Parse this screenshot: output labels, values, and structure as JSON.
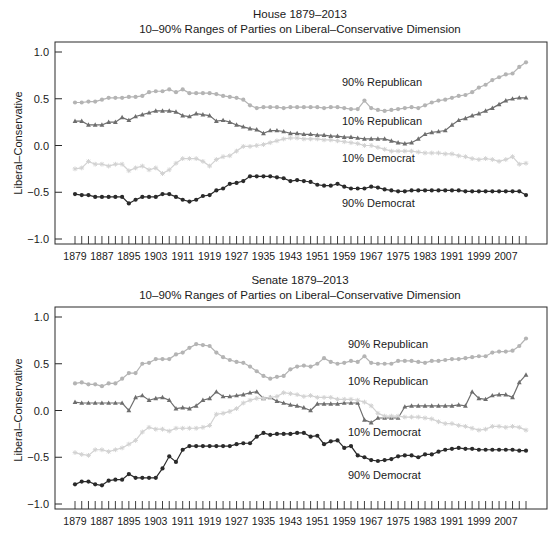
{
  "chart_data": [
    {
      "type": "line",
      "title": "House 1879–2013",
      "subtitle": "10–90% Ranges of Parties on Liberal–Conservative Dimension",
      "xlabel": "",
      "ylabel": "Liberal–Conservative",
      "ylim": [
        -1.0,
        1.0
      ],
      "yticks": [
        "1.0",
        "0.5",
        "0.0",
        "-0.5",
        "-1.0"
      ],
      "xtick_labels": [
        "1879",
        "1887",
        "1895",
        "1903",
        "1911",
        "1919",
        "1927",
        "1935",
        "1943",
        "1951",
        "1959",
        "1967",
        "1975",
        "1983",
        "1991",
        "1999",
        "2007"
      ],
      "x_start": 1879,
      "x_step": 2,
      "x_end": 2013,
      "grid": false,
      "legend": "inline annotations",
      "series": [
        {
          "name": "90% Republican",
          "color": "#b4b4b4",
          "marker": "circle",
          "values": [
            0.46,
            0.46,
            0.47,
            0.47,
            0.49,
            0.51,
            0.51,
            0.51,
            0.52,
            0.52,
            0.53,
            0.57,
            0.58,
            0.58,
            0.6,
            0.57,
            0.6,
            0.56,
            0.56,
            0.56,
            0.56,
            0.55,
            0.53,
            0.52,
            0.51,
            0.49,
            0.43,
            0.4,
            0.41,
            0.41,
            0.41,
            0.4,
            0.41,
            0.41,
            0.41,
            0.41,
            0.41,
            0.4,
            0.41,
            0.41,
            0.4,
            0.39,
            0.39,
            0.48,
            0.4,
            0.38,
            0.37,
            0.38,
            0.39,
            0.4,
            0.41,
            0.4,
            0.43,
            0.46,
            0.48,
            0.49,
            0.51,
            0.53,
            0.54,
            0.57,
            0.62,
            0.65,
            0.7,
            0.73,
            0.76,
            0.77,
            0.84,
            0.89,
            0.97
          ]
        },
        {
          "name": "10% Republican",
          "color": "#6e6e6e",
          "marker": "triangle",
          "values": [
            0.26,
            0.26,
            0.22,
            0.22,
            0.22,
            0.25,
            0.25,
            0.3,
            0.27,
            0.31,
            0.33,
            0.35,
            0.37,
            0.37,
            0.37,
            0.36,
            0.32,
            0.31,
            0.34,
            0.33,
            0.32,
            0.26,
            0.27,
            0.25,
            0.22,
            0.2,
            0.18,
            0.17,
            0.13,
            0.16,
            0.16,
            0.15,
            0.13,
            0.13,
            0.12,
            0.12,
            0.11,
            0.11,
            0.1,
            0.1,
            0.09,
            0.09,
            0.08,
            0.07,
            0.07,
            0.07,
            0.07,
            0.05,
            0.03,
            0.02,
            0.03,
            0.07,
            0.12,
            0.14,
            0.15,
            0.16,
            0.22,
            0.27,
            0.29,
            0.32,
            0.34,
            0.37,
            0.4,
            0.44,
            0.48,
            0.5,
            0.51,
            0.51,
            0.52
          ]
        },
        {
          "name": "10% Democrat",
          "color": "#d2d2d2",
          "marker": "star",
          "values": [
            -0.25,
            -0.24,
            -0.17,
            -0.2,
            -0.2,
            -0.22,
            -0.2,
            -0.2,
            -0.27,
            -0.24,
            -0.22,
            -0.26,
            -0.24,
            -0.3,
            -0.26,
            -0.19,
            -0.14,
            -0.14,
            -0.14,
            -0.17,
            -0.22,
            -0.15,
            -0.12,
            -0.11,
            -0.06,
            -0.01,
            -0.01,
            0.0,
            0.01,
            0.03,
            0.05,
            0.07,
            0.08,
            0.08,
            0.07,
            0.07,
            0.07,
            0.06,
            0.06,
            0.05,
            0.04,
            0.03,
            0.02,
            0.0,
            0.0,
            -0.02,
            -0.04,
            -0.06,
            -0.06,
            -0.06,
            -0.06,
            -0.07,
            -0.08,
            -0.08,
            -0.08,
            -0.09,
            -0.09,
            -0.11,
            -0.12,
            -0.14,
            -0.15,
            -0.14,
            -0.15,
            -0.17,
            -0.15,
            -0.12,
            -0.2,
            -0.19,
            -0.18
          ]
        },
        {
          "name": "90% Democrat",
          "color": "#2a2a2a",
          "marker": "circle",
          "values": [
            -0.52,
            -0.53,
            -0.53,
            -0.55,
            -0.55,
            -0.55,
            -0.55,
            -0.55,
            -0.62,
            -0.58,
            -0.55,
            -0.55,
            -0.55,
            -0.52,
            -0.52,
            -0.55,
            -0.58,
            -0.6,
            -0.58,
            -0.54,
            -0.53,
            -0.48,
            -0.46,
            -0.41,
            -0.4,
            -0.38,
            -0.33,
            -0.33,
            -0.33,
            -0.33,
            -0.34,
            -0.35,
            -0.38,
            -0.37,
            -0.38,
            -0.39,
            -0.42,
            -0.43,
            -0.43,
            -0.41,
            -0.44,
            -0.46,
            -0.46,
            -0.46,
            -0.44,
            -0.45,
            -0.47,
            -0.48,
            -0.49,
            -0.49,
            -0.48,
            -0.48,
            -0.48,
            -0.48,
            -0.48,
            -0.48,
            -0.48,
            -0.48,
            -0.49,
            -0.49,
            -0.49,
            -0.49,
            -0.49,
            -0.49,
            -0.49,
            -0.49,
            -0.49,
            -0.53,
            -0.5
          ]
        }
      ],
      "annotations": [
        "90% Republican",
        "10% Republican",
        "10% Democrat",
        "90% Democrat"
      ]
    },
    {
      "type": "line",
      "title": "Senate 1879–2013",
      "subtitle": "10–90% Ranges of Parties on Liberal–Conservative Dimension",
      "xlabel": "",
      "ylabel": "Liberal–Conservative",
      "ylim": [
        -1.0,
        1.0
      ],
      "yticks": [
        "1.0",
        "0.5",
        "0.0",
        "-0.5",
        "-1.0"
      ],
      "xtick_labels": [
        "1879",
        "1887",
        "1895",
        "1903",
        "1911",
        "1919",
        "1927",
        "1935",
        "1943",
        "1951",
        "1959",
        "1967",
        "1975",
        "1983",
        "1991",
        "1999",
        "2007"
      ],
      "x_start": 1879,
      "x_step": 2,
      "x_end": 2013,
      "grid": false,
      "legend": "inline annotations",
      "series": [
        {
          "name": "90% Republican",
          "color": "#b4b4b4",
          "marker": "circle",
          "values": [
            0.29,
            0.3,
            0.28,
            0.28,
            0.26,
            0.29,
            0.29,
            0.34,
            0.4,
            0.4,
            0.5,
            0.51,
            0.55,
            0.55,
            0.55,
            0.6,
            0.62,
            0.67,
            0.71,
            0.7,
            0.69,
            0.62,
            0.57,
            0.54,
            0.52,
            0.51,
            0.47,
            0.42,
            0.37,
            0.34,
            0.36,
            0.37,
            0.44,
            0.47,
            0.48,
            0.47,
            0.5,
            0.56,
            0.52,
            0.5,
            0.51,
            0.53,
            0.52,
            0.58,
            0.51,
            0.5,
            0.5,
            0.5,
            0.53,
            0.53,
            0.53,
            0.52,
            0.51,
            0.53,
            0.53,
            0.54,
            0.55,
            0.55,
            0.56,
            0.57,
            0.58,
            0.58,
            0.62,
            0.63,
            0.63,
            0.64,
            0.69,
            0.77,
            0.78,
            0.78
          ]
        },
        {
          "name": "10% Republican",
          "color": "#6e6e6e",
          "marker": "triangle",
          "values": [
            0.09,
            0.08,
            0.08,
            0.08,
            0.08,
            0.08,
            0.08,
            0.08,
            0.0,
            0.14,
            0.16,
            0.11,
            0.13,
            0.14,
            0.11,
            0.02,
            0.03,
            0.02,
            0.05,
            0.11,
            0.13,
            0.2,
            0.15,
            0.15,
            0.16,
            0.17,
            0.19,
            0.2,
            0.13,
            0.14,
            0.1,
            0.08,
            0.06,
            0.05,
            0.03,
            0.0,
            0.07,
            0.07,
            0.07,
            0.07,
            0.08,
            0.08,
            0.08,
            -0.1,
            -0.13,
            -0.08,
            -0.08,
            -0.08,
            -0.08,
            0.04,
            0.05,
            0.05,
            0.05,
            0.05,
            0.05,
            0.05,
            0.05,
            0.06,
            0.05,
            0.2,
            0.13,
            0.12,
            0.16,
            0.17,
            0.17,
            0.14,
            0.3,
            0.38
          ]
        },
        {
          "name": "10% Democrat",
          "color": "#d2d2d2",
          "marker": "star",
          "values": [
            -0.45,
            -0.47,
            -0.48,
            -0.42,
            -0.42,
            -0.44,
            -0.42,
            -0.4,
            -0.36,
            -0.32,
            -0.23,
            -0.18,
            -0.2,
            -0.2,
            -0.22,
            -0.19,
            -0.19,
            -0.19,
            -0.19,
            -0.18,
            -0.16,
            -0.04,
            -0.03,
            -0.01,
            0.02,
            0.08,
            0.11,
            0.13,
            0.13,
            0.14,
            0.15,
            0.19,
            0.18,
            0.17,
            0.15,
            0.16,
            0.14,
            0.14,
            0.14,
            0.12,
            0.12,
            0.12,
            0.11,
            0.09,
            0.05,
            -0.03,
            -0.06,
            -0.06,
            -0.06,
            -0.07,
            -0.07,
            -0.07,
            -0.08,
            -0.09,
            -0.12,
            -0.14,
            -0.14,
            -0.16,
            -0.17,
            -0.19,
            -0.21,
            -0.2,
            -0.17,
            -0.17,
            -0.18,
            -0.17,
            -0.18,
            -0.21
          ]
        },
        {
          "name": "90% Democrat",
          "color": "#2a2a2a",
          "marker": "circle",
          "values": [
            -0.79,
            -0.76,
            -0.76,
            -0.79,
            -0.8,
            -0.75,
            -0.74,
            -0.74,
            -0.68,
            -0.72,
            -0.72,
            -0.72,
            -0.72,
            -0.62,
            -0.49,
            -0.55,
            -0.42,
            -0.38,
            -0.38,
            -0.38,
            -0.38,
            -0.38,
            -0.38,
            -0.38,
            -0.36,
            -0.35,
            -0.35,
            -0.28,
            -0.24,
            -0.26,
            -0.25,
            -0.25,
            -0.25,
            -0.24,
            -0.24,
            -0.28,
            -0.27,
            -0.36,
            -0.33,
            -0.32,
            -0.4,
            -0.38,
            -0.48,
            -0.5,
            -0.53,
            -0.54,
            -0.53,
            -0.52,
            -0.49,
            -0.48,
            -0.48,
            -0.5,
            -0.47,
            -0.47,
            -0.44,
            -0.42,
            -0.41,
            -0.4,
            -0.41,
            -0.41,
            -0.42,
            -0.42,
            -0.42,
            -0.42,
            -0.42,
            -0.42,
            -0.43,
            -0.43,
            -0.43,
            -0.48
          ]
        }
      ],
      "annotations": [
        "90% Republican",
        "10% Republican",
        "10% Democrat",
        "90% Democrat"
      ]
    }
  ],
  "panels": [
    {
      "title": "House 1879–2013",
      "subtitle": "10–90% Ranges of Parties on Liberal–Conservative Dimension",
      "ylabel": "Liberal–Conservative",
      "labels": {
        "r90": "90% Republican",
        "r10": "10% Republican",
        "d10": "10% Democrat",
        "d90": "90% Democrat"
      }
    },
    {
      "title": "Senate 1879–2013",
      "subtitle": "10–90% Ranges of Parties on Liberal–Conservative Dimension",
      "ylabel": "Liberal–Conservative",
      "labels": {
        "r90": "90% Republican",
        "r10": "10% Republican",
        "d10": "10% Democrat",
        "d90": "90% Democrat"
      }
    }
  ]
}
